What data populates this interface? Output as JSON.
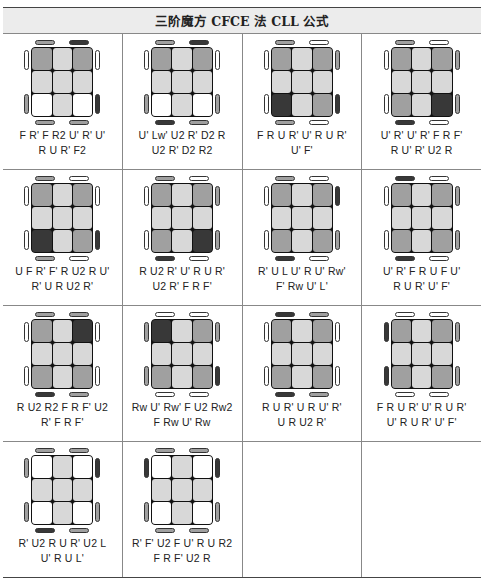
{
  "title": "三阶魔方 CFCE 法 CLL 公式",
  "colors": {
    "W": "#ffffff",
    "L": "#d8d8d8",
    "M": "#a0a0a0",
    "D": "#383838"
  },
  "rows": [
    [
      {
        "alg1": "F R' F R2 U' R' U'",
        "alg2": "R U R' F2",
        "stickers": [
          "M",
          "L",
          "M",
          "L",
          "L",
          "L",
          "W",
          "L",
          "W"
        ],
        "top": [
          "M",
          "D"
        ],
        "bottom": [
          "M",
          "M"
        ],
        "left": [
          "W",
          "M"
        ],
        "right": [
          "W",
          "D"
        ]
      },
      {
        "alg1": "U' Lw' U2 R' D2 R",
        "alg2": "U2 R' D2 R2",
        "stickers": [
          "M",
          "L",
          "M",
          "L",
          "L",
          "L",
          "W",
          "L",
          "W"
        ],
        "top": [
          "M",
          "D"
        ],
        "bottom": [
          "D",
          "M"
        ],
        "left": [
          "W",
          "M"
        ],
        "right": [
          "W",
          "M"
        ]
      },
      {
        "alg1": "F R U R' U' R U R'",
        "alg2": "U' F'",
        "stickers": [
          "M",
          "L",
          "M",
          "L",
          "L",
          "L",
          "D",
          "L",
          "M"
        ],
        "top": [
          "M",
          "W"
        ],
        "bottom": [
          "M",
          "W"
        ],
        "left": [
          "W",
          "W"
        ],
        "right": [
          "M",
          "D"
        ]
      },
      {
        "alg1": "U' R' U' R' F R F'",
        "alg2": "R U' R' U2 R",
        "stickers": [
          "M",
          "L",
          "M",
          "L",
          "L",
          "L",
          "M",
          "L",
          "D"
        ],
        "top": [
          "M",
          "W"
        ],
        "bottom": [
          "D",
          "W"
        ],
        "left": [
          "W",
          "W"
        ],
        "right": [
          "M",
          "M"
        ]
      }
    ],
    [
      {
        "alg1": "U F R' F' R U2 R U'",
        "alg2": "R' U R U2 R'",
        "stickers": [
          "M",
          "L",
          "M",
          "L",
          "L",
          "L",
          "D",
          "L",
          "M"
        ],
        "top": [
          "M",
          "W"
        ],
        "bottom": [
          "M",
          "W"
        ],
        "left": [
          "W",
          "W"
        ],
        "right": [
          "W",
          "D"
        ]
      },
      {
        "alg1": "R U2 R' U' R U R'",
        "alg2": "U2 R' F R F'",
        "stickers": [
          "M",
          "L",
          "M",
          "L",
          "L",
          "L",
          "M",
          "L",
          "D"
        ],
        "top": [
          "M",
          "W"
        ],
        "bottom": [
          "D",
          "W"
        ],
        "left": [
          "W",
          "W"
        ],
        "right": [
          "M",
          "M"
        ]
      },
      {
        "alg1": "R' U L U' R U' Rw'",
        "alg2": "F' Rw U' L'",
        "stickers": [
          "M",
          "L",
          "M",
          "L",
          "L",
          "L",
          "M",
          "L",
          "M"
        ],
        "top": [
          "M",
          "W"
        ],
        "bottom": [
          "D",
          "W"
        ],
        "left": [
          "W",
          "W"
        ],
        "right": [
          "D",
          "M"
        ]
      },
      {
        "alg1": "U' R' F R U F U'",
        "alg2": "R U R' U' F'",
        "stickers": [
          "M",
          "L",
          "M",
          "L",
          "L",
          "L",
          "M",
          "L",
          "M"
        ],
        "top": [
          "D",
          "W"
        ],
        "bottom": [
          "D",
          "W"
        ],
        "left": [
          "W",
          "W"
        ],
        "right": [
          "M",
          "M"
        ]
      }
    ],
    [
      {
        "alg1": "R U2 R2 F R F' U2",
        "alg2": "R' F R F'",
        "stickers": [
          "M",
          "L",
          "D",
          "L",
          "L",
          "L",
          "M",
          "L",
          "M"
        ],
        "top": [
          "M",
          "M"
        ],
        "bottom": [
          "D",
          "M"
        ],
        "left": [
          "W",
          "W"
        ],
        "right": [
          "W",
          "W"
        ]
      },
      {
        "alg1": "Rw U' Rw' F U2 Rw2",
        "alg2": "F Rw U' Rw",
        "stickers": [
          "D",
          "L",
          "M",
          "L",
          "L",
          "L",
          "M",
          "L",
          "M"
        ],
        "top": [
          "W",
          "W"
        ],
        "bottom": [
          "W",
          "W"
        ],
        "left": [
          "M",
          "M"
        ],
        "right": [
          "M",
          "D"
        ]
      },
      {
        "alg1": "R U R' U R U' R'",
        "alg2": "U R U2 R'",
        "stickers": [
          "M",
          "L",
          "M",
          "L",
          "L",
          "L",
          "M",
          "L",
          "M"
        ],
        "top": [
          "D",
          "M"
        ],
        "bottom": [
          "D",
          "M"
        ],
        "left": [
          "W",
          "W"
        ],
        "right": [
          "W",
          "W"
        ]
      },
      {
        "alg1": "F R U R' U' R U R'",
        "alg2": "U' R U R' U' F'",
        "stickers": [
          "M",
          "L",
          "M",
          "L",
          "L",
          "L",
          "M",
          "L",
          "M"
        ],
        "top": [
          "W",
          "W"
        ],
        "bottom": [
          "W",
          "W"
        ],
        "left": [
          "D",
          "D"
        ],
        "right": [
          "M",
          "M"
        ]
      }
    ],
    [
      {
        "alg1": "R' U2 R U R' U2 L",
        "alg2": "U' R U L'",
        "stickers": [
          "W",
          "L",
          "W",
          "L",
          "L",
          "L",
          "W",
          "L",
          "W"
        ],
        "top": [
          "M",
          "M"
        ],
        "bottom": [
          "D",
          "M"
        ],
        "left": [
          "M",
          "M"
        ],
        "right": [
          "D",
          "M"
        ]
      },
      {
        "alg1": "R' F' U2 F U' R U R2",
        "alg2": "F R F' U2 R",
        "stickers": [
          "W",
          "L",
          "W",
          "L",
          "L",
          "L",
          "W",
          "L",
          "W"
        ],
        "top": [
          "M",
          "M"
        ],
        "bottom": [
          "M",
          "M"
        ],
        "left": [
          "D",
          "M"
        ],
        "right": [
          "D",
          "M"
        ]
      },
      null,
      null
    ]
  ]
}
